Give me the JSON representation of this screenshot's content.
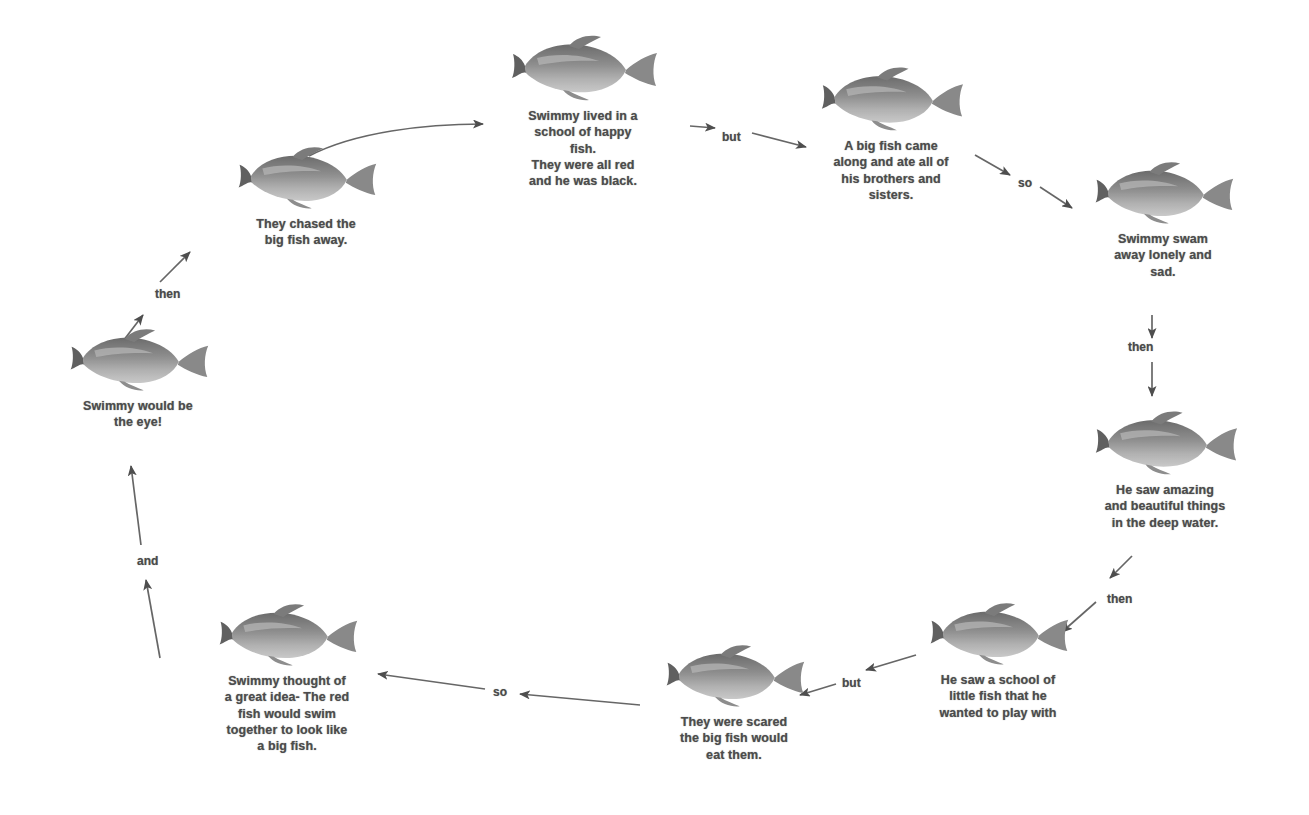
{
  "theme": {
    "background": "#ffffff",
    "text_color": "#4c4c4c",
    "edge_color": "#555555",
    "fish_body_dark": "#6f6f6f",
    "fish_body_mid": "#9a9a9a",
    "fish_belly_light": "#d6d6d6"
  },
  "nodes": [
    {
      "id": "node-1",
      "order": 1,
      "icon": "fish-icon",
      "caption": "Swimmy lived in a\nschool of happy\nfish.\nThey were all red\nand he was black.",
      "x": 488,
      "y": 28,
      "fish_width": 152,
      "fish_height": 78,
      "caption_width": 190
    },
    {
      "id": "node-2",
      "order": 2,
      "icon": "fish-icon",
      "caption": "A big fish came\nalong and ate all of\nhis brothers and\nsisters.",
      "x": 793,
      "y": 60,
      "fish_width": 148,
      "fish_height": 76,
      "caption_width": 196
    },
    {
      "id": "node-3",
      "order": 3,
      "icon": "fish-icon",
      "caption": "Swimmy swam\naway lonely and\nsad.",
      "x": 1075,
      "y": 155,
      "fish_width": 148,
      "fish_height": 74,
      "caption_width": 176
    },
    {
      "id": "node-4",
      "order": 4,
      "icon": "fish-icon",
      "caption": "He saw amazing\nand beautiful things\nin the deep water.",
      "x": 1065,
      "y": 404,
      "fish_width": 152,
      "fish_height": 76,
      "caption_width": 200
    },
    {
      "id": "node-5",
      "order": 5,
      "icon": "fish-icon",
      "caption": "He saw a school of\nlittle fish that he\nwanted to play with",
      "x": 900,
      "y": 596,
      "fish_width": 150,
      "fish_height": 74,
      "caption_width": 196
    },
    {
      "id": "node-6",
      "order": 6,
      "icon": "fish-icon",
      "caption": "They were scared\nthe big fish would\neat them.",
      "x": 642,
      "y": 638,
      "fish_width": 148,
      "fish_height": 74,
      "caption_width": 184
    },
    {
      "id": "node-7",
      "order": 7,
      "icon": "fish-icon",
      "caption": "Swimmy thought of\na great idea- The red\nfish would swim\ntogether to look like\na big fish.",
      "x": 184,
      "y": 597,
      "fish_width": 150,
      "fish_height": 74,
      "caption_width": 206
    },
    {
      "id": "node-8",
      "order": 8,
      "icon": "fish-icon",
      "caption": "Swimmy would be\nthe eye!",
      "x": 46,
      "y": 322,
      "fish_width": 150,
      "fish_height": 74,
      "caption_width": 184
    },
    {
      "id": "node-9",
      "order": 9,
      "icon": "fish-icon",
      "caption": "They chased the\nbig fish away.",
      "x": 216,
      "y": 140,
      "fish_width": 150,
      "fish_height": 74,
      "caption_width": 180
    }
  ],
  "edges": [
    {
      "id": "edge-1",
      "from": "node-9",
      "to": "node-1",
      "label": "",
      "label_x": 0,
      "label_y": 0
    },
    {
      "id": "edge-2",
      "from": "node-1",
      "to": "node-2",
      "label": "but",
      "label_x": 722,
      "label_y": 130
    },
    {
      "id": "edge-3",
      "from": "node-2",
      "to": "node-3",
      "label": "so",
      "label_x": 1018,
      "label_y": 176
    },
    {
      "id": "edge-4",
      "from": "node-3",
      "to": "node-4",
      "label": "then",
      "label_x": 1128,
      "label_y": 347
    },
    {
      "id": "edge-5",
      "from": "node-4",
      "to": "node-5",
      "label": "then",
      "label_x": 1107,
      "label_y": 592
    },
    {
      "id": "edge-6",
      "from": "node-5",
      "to": "node-6",
      "label": "but",
      "label_x": 842,
      "label_y": 676
    },
    {
      "id": "edge-7",
      "from": "node-6",
      "to": "node-7",
      "label": "so",
      "label_x": 493,
      "label_y": 690
    },
    {
      "id": "edge-8",
      "from": "node-7",
      "to": "node-8",
      "label": "and",
      "label_x": 137,
      "label_y": 554
    },
    {
      "id": "edge-9",
      "from": "node-8",
      "to": "node-9",
      "label": "then",
      "label_x": 155,
      "label_y": 287
    }
  ]
}
